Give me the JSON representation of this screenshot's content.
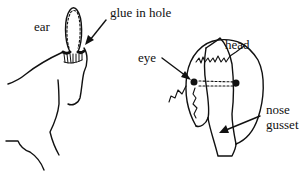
{
  "diagram": {
    "labels": {
      "ear": "ear",
      "glue": "glue in hole",
      "eye": "eye",
      "head": "head",
      "nose_line1": "nose",
      "nose_line2": "gusset"
    },
    "colors": {
      "ink": "#111111",
      "background": "#ffffff"
    }
  }
}
